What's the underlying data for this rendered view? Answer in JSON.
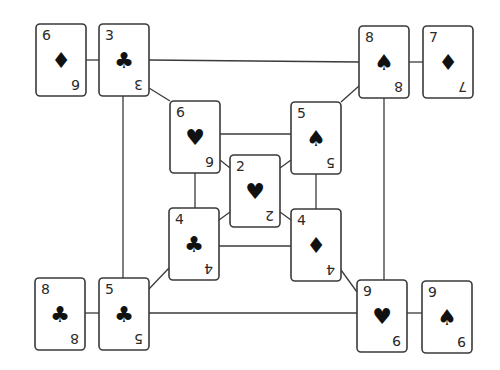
{
  "diagram": {
    "title": "",
    "cards": [
      {
        "id": "c_6D",
        "rank": "6",
        "suit": "diamond",
        "suit_glyph": "♦"
      },
      {
        "id": "c_3C",
        "rank": "3",
        "suit": "club",
        "suit_glyph": "♣"
      },
      {
        "id": "c_8S",
        "rank": "8",
        "suit": "spade",
        "suit_glyph": "♠"
      },
      {
        "id": "c_7D",
        "rank": "7",
        "suit": "diamond",
        "suit_glyph": "♦"
      },
      {
        "id": "c_6H",
        "rank": "6",
        "suit": "heart",
        "suit_glyph": "♥"
      },
      {
        "id": "c_5S",
        "rank": "5",
        "suit": "spade",
        "suit_glyph": "♠"
      },
      {
        "id": "c_2H",
        "rank": "2",
        "suit": "heart",
        "suit_glyph": "♥"
      },
      {
        "id": "c_4C",
        "rank": "4",
        "suit": "club",
        "suit_glyph": "♣"
      },
      {
        "id": "c_4D",
        "rank": "4",
        "suit": "diamond",
        "suit_glyph": "♦"
      },
      {
        "id": "c_8C",
        "rank": "8",
        "suit": "club",
        "suit_glyph": "♣"
      },
      {
        "id": "c_5C",
        "rank": "5",
        "suit": "club",
        "suit_glyph": "♣"
      },
      {
        "id": "c_9H",
        "rank": "9",
        "suit": "heart",
        "suit_glyph": "♥"
      },
      {
        "id": "c_9S",
        "rank": "9",
        "suit": "spade",
        "suit_glyph": "♠"
      }
    ],
    "edges": [
      [
        "c_6D",
        "c_3C"
      ],
      [
        "c_3C",
        "c_8S"
      ],
      [
        "c_8S",
        "c_7D"
      ],
      [
        "c_3C",
        "c_5C"
      ],
      [
        "c_8S",
        "c_9H"
      ],
      [
        "c_5C",
        "c_9H"
      ],
      [
        "c_8C",
        "c_5C"
      ],
      [
        "c_9H",
        "c_9S"
      ],
      [
        "c_3C",
        "c_6H"
      ],
      [
        "c_8S",
        "c_5S"
      ],
      [
        "c_5C",
        "c_4C"
      ],
      [
        "c_9H",
        "c_4D"
      ],
      [
        "c_6H",
        "c_5S"
      ],
      [
        "c_6H",
        "c_4C"
      ],
      [
        "c_5S",
        "c_4D"
      ],
      [
        "c_4C",
        "c_4D"
      ],
      [
        "c_6H",
        "c_2H"
      ],
      [
        "c_5S",
        "c_2H"
      ],
      [
        "c_4C",
        "c_2H"
      ],
      [
        "c_4D",
        "c_2H"
      ]
    ]
  }
}
